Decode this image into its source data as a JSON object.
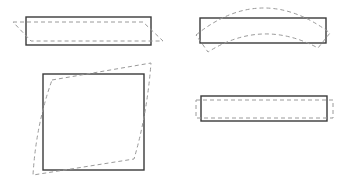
{
  "diagram": {
    "colors": {
      "background": "#ffffff",
      "undeformed_stroke": "#3a3a3a",
      "deformed_stroke": "#9a9a9a"
    },
    "panels": [
      {
        "id": "shear-beam",
        "position": "top-left",
        "undeformed": {
          "x": 26,
          "y": 17,
          "w": 125,
          "h": 28
        },
        "deformed_path": "M13,22 L143,22 L163,41 L31,41 Z"
      },
      {
        "id": "bending-beam",
        "position": "top-right",
        "undeformed": {
          "x": 200,
          "y": 18,
          "w": 126,
          "h": 25
        },
        "deformed_path": "M196,35 Q262,-18 330,33 L318,48 Q262,18 208,52 Z"
      },
      {
        "id": "shear-square",
        "position": "bottom-left",
        "undeformed": {
          "x": 43,
          "y": 74,
          "w": 101,
          "h": 96
        },
        "deformed_path": "M52,80 L151,63 Q147,115 134,159 L33,175 Q36,125 52,80 Z"
      },
      {
        "id": "axial-bar",
        "position": "bottom-right",
        "undeformed": {
          "x": 201,
          "y": 96,
          "w": 126,
          "h": 25
        },
        "deformed_path": "M196,100 L333,100 L333,118 L196,118 Z"
      }
    ]
  }
}
